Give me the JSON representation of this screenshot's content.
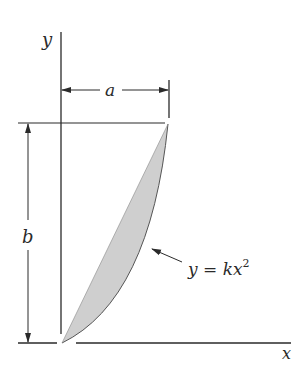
{
  "diagram": {
    "axes": {
      "x_label": "x",
      "y_label": "y"
    },
    "dimensions": {
      "width_label": "a",
      "height_label": "b"
    },
    "curve": {
      "equation_prefix": "y = kx",
      "equation_exponent": "2"
    },
    "colors": {
      "line": "#2a2a2a",
      "fill": "#cfcfcf",
      "background": "#ffffff"
    }
  }
}
